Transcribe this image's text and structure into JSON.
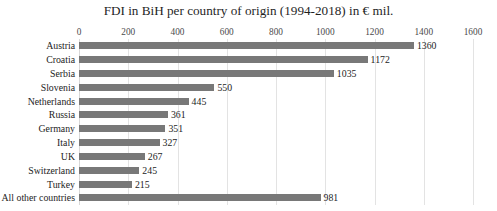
{
  "chart_data": {
    "type": "bar",
    "orientation": "horizontal",
    "title": "FDI in BiH per country of origin (1994-2018) in € mil.",
    "xlabel": "",
    "ylabel": "",
    "xlim": [
      0,
      1600
    ],
    "xticks": [
      0,
      200,
      400,
      600,
      800,
      1000,
      1200,
      1400,
      1600
    ],
    "xtick_labels": [
      "0",
      "200",
      "400",
      "600",
      "800",
      "1000",
      "1200",
      "1400",
      "1600"
    ],
    "grid": true,
    "grid_axis": "x",
    "legend": false,
    "data_labels": true,
    "categories": [
      "Austria",
      "Croatia",
      "Serbia",
      "Slovenia",
      "Netherlands",
      "Russia",
      "Germany",
      "Italy",
      "UK",
      "Switzerland",
      "Turkey",
      "All other countries"
    ],
    "values": [
      1360,
      1172,
      1035,
      550,
      445,
      361,
      351,
      327,
      267,
      245,
      215,
      981
    ],
    "value_labels": [
      "1360",
      "1172",
      "1035",
      "550",
      "445",
      "361",
      "351",
      "327",
      "267",
      "245",
      "215",
      "981"
    ],
    "bar_color": "#787878",
    "grid_color": "#e3e3e3",
    "background_color": "#ffffff",
    "text_color": "#232323"
  }
}
